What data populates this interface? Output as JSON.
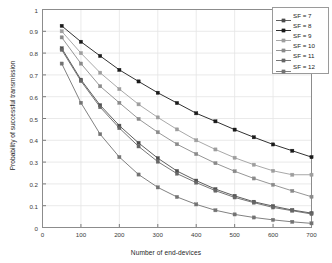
{
  "chart_data": {
    "type": "line",
    "title": "",
    "xlabel": "Number of end-devices",
    "ylabel": "Probability of successful transmission",
    "xlim": [
      0,
      700
    ],
    "ylim": [
      0,
      1
    ],
    "xticks": [
      0,
      100,
      200,
      300,
      400,
      500,
      600,
      700
    ],
    "yticks": [
      0,
      0.1,
      0.2,
      0.3,
      0.4,
      0.5,
      0.6,
      0.7,
      0.8,
      0.9,
      1
    ],
    "grid": true,
    "legend_position": "top-right",
    "marker": "square-star",
    "x": [
      50,
      100,
      150,
      200,
      250,
      300,
      350,
      400,
      450,
      500,
      550,
      600,
      650,
      700
    ],
    "series": [
      {
        "name": "SF = 7",
        "color": "#4d4d4d",
        "values": [
          0.822,
          0.678,
          0.561,
          0.467,
          0.388,
          0.318,
          0.259,
          0.215,
          0.176,
          0.145,
          0.118,
          0.098,
          0.08,
          0.066
        ]
      },
      {
        "name": "SF = 8",
        "color": "#1a1a1a",
        "values": [
          0.925,
          0.852,
          0.787,
          0.723,
          0.67,
          0.618,
          0.571,
          0.524,
          0.487,
          0.449,
          0.414,
          0.381,
          0.352,
          0.323
        ]
      },
      {
        "name": "SF = 9",
        "color": "#9e9e9e",
        "values": [
          0.9,
          0.8,
          0.71,
          0.635,
          0.565,
          0.505,
          0.45,
          0.4,
          0.358,
          0.32,
          0.288,
          0.26,
          0.242,
          0.242
        ]
      },
      {
        "name": "SF = 10",
        "color": "#8a8a8a",
        "values": [
          0.872,
          0.752,
          0.648,
          0.572,
          0.498,
          0.437,
          0.382,
          0.337,
          0.295,
          0.258,
          0.225,
          0.196,
          0.168,
          0.141
        ]
      },
      {
        "name": "SF = 11",
        "color": "#666666",
        "values": [
          0.815,
          0.672,
          0.552,
          0.456,
          0.372,
          0.302,
          0.247,
          0.206,
          0.169,
          0.138,
          0.114,
          0.092,
          0.077,
          0.062
        ]
      },
      {
        "name": "SF = 12",
        "color": "#737373",
        "values": [
          0.752,
          0.572,
          0.428,
          0.323,
          0.243,
          0.184,
          0.14,
          0.106,
          0.079,
          0.06,
          0.046,
          0.035,
          0.026,
          0.019
        ]
      }
    ]
  },
  "legend": {
    "items": [
      {
        "label": "SF = 7"
      },
      {
        "label": "SF = 8"
      },
      {
        "label": "SF = 9"
      },
      {
        "label": "SF = 10"
      },
      {
        "label": "SF = 11"
      },
      {
        "label": "SF = 12"
      }
    ]
  },
  "axes": {
    "xlabel": "Number of end-devices",
    "ylabel": "Probability of successful transmission"
  }
}
